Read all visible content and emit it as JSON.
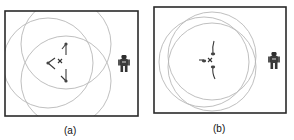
{
  "figure": {
    "panels": [
      {
        "id": "a",
        "caption": "(a)",
        "frame": {
          "x": 5,
          "y": 11,
          "w": 133,
          "h": 105
        },
        "range_circles": [
          {
            "cx": 66,
            "cy": 44,
            "r": 45
          },
          {
            "cx": 48,
            "cy": 63,
            "r": 45
          },
          {
            "cx": 66,
            "cy": 81,
            "r": 45
          }
        ],
        "target": {
          "x": 60,
          "y": 61,
          "symbol": "x"
        },
        "agent": {
          "x": 124,
          "y": 64,
          "icon": "robot-icon"
        },
        "formation": "spread triangle"
      },
      {
        "id": "b",
        "caption": "(b)",
        "frame": {
          "x": 154,
          "y": 7,
          "w": 132,
          "h": 106
        },
        "range_circles": [
          {
            "cx": 212,
            "cy": 56,
            "r": 44
          },
          {
            "cx": 204,
            "cy": 62,
            "r": 45
          },
          {
            "cx": 212,
            "cy": 67,
            "r": 44
          }
        ],
        "target": {
          "x": 210,
          "y": 60,
          "symbol": "x"
        },
        "agent": {
          "x": 274,
          "y": 61,
          "icon": "robot-icon"
        },
        "formation": "compact cluster"
      }
    ],
    "colors": {
      "frame": "#2a2a2a",
      "circle": "#b8b8b8",
      "marker": "#3a3a3a"
    }
  }
}
